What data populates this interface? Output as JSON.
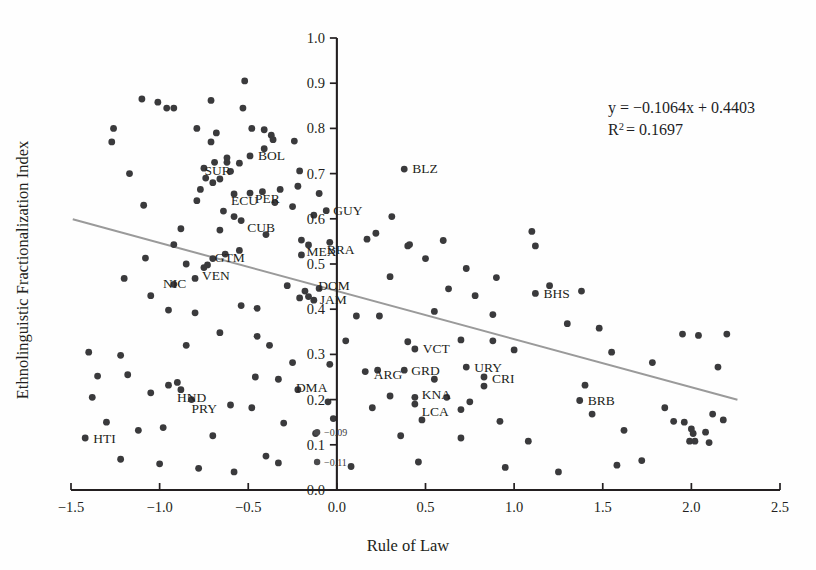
{
  "figure": {
    "background_color": "#fefefe",
    "point_color": "#3a3a3c",
    "trendline_color": "#9a9a9a",
    "axis_color": "#231f20"
  },
  "annotations": {
    "equation": "y = −0.1064x + 0.4403",
    "r_squared_prefix": "R",
    "r_squared_sup": "2",
    "r_squared_value": "= 0.1697",
    "mini_labels": [
      {
        "text": "−0.09",
        "x": -0.01,
        "y": 0.128
      },
      {
        "text": "−0.11",
        "x": -0.01,
        "y": 0.062
      }
    ]
  },
  "chart_data": {
    "type": "scatter",
    "title": "",
    "xlabel": "Rule of Law",
    "ylabel": "Ethnolinguistic Fractionalization Index",
    "xlim": [
      -1.5,
      2.5
    ],
    "ylim": [
      0.0,
      1.0
    ],
    "xticks": [
      -1.5,
      -1.0,
      -0.5,
      0.0,
      0.5,
      1.0,
      1.5,
      2.0,
      2.5
    ],
    "xtick_labels": [
      "−1.5",
      "−1.0",
      "−0.5",
      "0.0",
      "0.5",
      "1.0",
      "1.5",
      "2.0",
      "2.5"
    ],
    "yticks": [
      0.0,
      0.1,
      0.2,
      0.3,
      0.4,
      0.5,
      0.6,
      0.7,
      0.8,
      0.9,
      1.0
    ],
    "ytick_labels": [
      "0.0",
      "0.1",
      "0.2",
      "0.3",
      "0.4",
      "0.5",
      "0.6",
      "0.7",
      "0.8",
      "0.9",
      "1.0"
    ],
    "grid": false,
    "legend": "none",
    "yaxis_position_on_x": 0.0,
    "trendline": {
      "type": "linear",
      "slope": -0.1064,
      "intercept": 0.4403,
      "x_start": -1.49,
      "x_end": 2.26,
      "equation_label": "y = −0.1064x + 0.4403",
      "r_squared": 0.1697
    },
    "labeled_points": [
      {
        "code": "BOL",
        "x": -0.49,
        "y": 0.739,
        "label_dx": 8,
        "label_dy": 4
      },
      {
        "code": "SUR",
        "x": -0.6,
        "y": 0.705,
        "label_dx": -26,
        "label_dy": 4
      },
      {
        "code": "ECU",
        "x": -0.58,
        "y": 0.655,
        "label_dx": -3,
        "label_dy": 11
      },
      {
        "code": "PER",
        "x": -0.49,
        "y": 0.657,
        "label_dx": 5,
        "label_dy": 10
      },
      {
        "code": "CUB",
        "x": -0.54,
        "y": 0.596,
        "label_dx": 6,
        "label_dy": 11
      },
      {
        "code": "GUY",
        "x": -0.06,
        "y": 0.618,
        "label_dx": 7,
        "label_dy": 4
      },
      {
        "code": "MEX",
        "x": -0.16,
        "y": 0.542,
        "label_dx": -2,
        "label_dy": 11
      },
      {
        "code": "BRA",
        "x": -0.04,
        "y": 0.548,
        "label_dx": -3,
        "label_dy": 12
      },
      {
        "code": "GTM",
        "x": -0.7,
        "y": 0.512,
        "label_dx": 2,
        "label_dy": 3
      },
      {
        "code": "VEN",
        "x": -0.75,
        "y": 0.492,
        "label_dx": -2,
        "label_dy": 12
      },
      {
        "code": "NIC",
        "x": -0.8,
        "y": 0.468,
        "label_dx": -32,
        "label_dy": 10
      },
      {
        "code": "DOM",
        "x": -0.1,
        "y": 0.446,
        "label_dx": -1,
        "label_dy": 2
      },
      {
        "code": "JAM",
        "x": -0.13,
        "y": 0.42,
        "label_dx": 6,
        "label_dy": 4
      },
      {
        "code": "BLZ",
        "x": 0.38,
        "y": 0.71,
        "label_dx": 8,
        "label_dy": 4
      },
      {
        "code": "BHS",
        "x": 1.12,
        "y": 0.435,
        "label_dx": 8,
        "label_dy": 5
      },
      {
        "code": "VCT",
        "x": 0.44,
        "y": 0.312,
        "label_dx": 8,
        "label_dy": 4
      },
      {
        "code": "ARG",
        "x": 0.23,
        "y": 0.265,
        "label_dx": -4,
        "label_dy": 9
      },
      {
        "code": "GRD",
        "x": 0.38,
        "y": 0.265,
        "label_dx": 7,
        "label_dy": 5
      },
      {
        "code": "URY",
        "x": 0.73,
        "y": 0.272,
        "label_dx": 8,
        "label_dy": 5
      },
      {
        "code": "CRI",
        "x": 0.83,
        "y": 0.25,
        "label_dx": 8,
        "label_dy": 6
      },
      {
        "code": "KNA",
        "x": 0.44,
        "y": 0.205,
        "label_dx": 7,
        "label_dy": 2
      },
      {
        "code": "LCA",
        "x": 0.44,
        "y": 0.19,
        "label_dx": 7,
        "label_dy": 12
      },
      {
        "code": "DMA",
        "x": -0.22,
        "y": 0.222,
        "label_dx": -2,
        "label_dy": 2
      },
      {
        "code": "HND",
        "x": -0.88,
        "y": 0.222,
        "label_dx": -4,
        "label_dy": 12
      },
      {
        "code": "PRY",
        "x": -0.82,
        "y": 0.2,
        "label_dx": 0,
        "label_dy": 13
      },
      {
        "code": "HTI",
        "x": -1.42,
        "y": 0.115,
        "label_dx": 8,
        "label_dy": 5
      },
      {
        "code": "BRB",
        "x": 1.37,
        "y": 0.198,
        "label_dx": 8,
        "label_dy": 4
      }
    ],
    "unlabeled_points": [
      [
        -1.1,
        0.865
      ],
      [
        -1.01,
        0.858
      ],
      [
        -0.96,
        0.845
      ],
      [
        -0.92,
        0.845
      ],
      [
        -0.71,
        0.862
      ],
      [
        -0.52,
        0.905
      ],
      [
        -0.53,
        0.845
      ],
      [
        -1.26,
        0.8
      ],
      [
        -1.27,
        0.77
      ],
      [
        -0.79,
        0.8
      ],
      [
        -0.68,
        0.79
      ],
      [
        -0.48,
        0.8
      ],
      [
        -0.41,
        0.797
      ],
      [
        -0.37,
        0.785
      ],
      [
        -0.36,
        0.775
      ],
      [
        -0.41,
        0.755
      ],
      [
        -0.71,
        0.77
      ],
      [
        -0.24,
        0.772
      ],
      [
        -0.69,
        0.725
      ],
      [
        -0.75,
        0.712
      ],
      [
        -0.55,
        0.723
      ],
      [
        -1.17,
        0.7
      ],
      [
        -0.21,
        0.706
      ],
      [
        -0.74,
        0.69
      ],
      [
        -0.7,
        0.68
      ],
      [
        -0.66,
        0.688
      ],
      [
        -0.62,
        0.735
      ],
      [
        -0.62,
        0.725
      ],
      [
        -0.77,
        0.665
      ],
      [
        -0.32,
        0.665
      ],
      [
        -0.22,
        0.672
      ],
      [
        -0.42,
        0.66
      ],
      [
        -0.1,
        0.656
      ],
      [
        -0.79,
        0.64
      ],
      [
        -0.64,
        0.617
      ],
      [
        -0.58,
        0.605
      ],
      [
        -0.35,
        0.636
      ],
      [
        -0.25,
        0.627
      ],
      [
        -1.09,
        0.63
      ],
      [
        -0.13,
        0.608
      ],
      [
        -0.88,
        0.578
      ],
      [
        -0.66,
        0.575
      ],
      [
        -0.4,
        0.565
      ],
      [
        -0.2,
        0.553
      ],
      [
        0.31,
        0.605
      ],
      [
        -0.92,
        0.543
      ],
      [
        -0.63,
        0.522
      ],
      [
        -0.55,
        0.53
      ],
      [
        -0.2,
        0.52
      ],
      [
        0.5,
        0.512
      ],
      [
        -1.08,
        0.513
      ],
      [
        -0.85,
        0.5
      ],
      [
        -0.73,
        0.498
      ],
      [
        0.17,
        0.555
      ],
      [
        0.22,
        0.568
      ],
      [
        0.6,
        0.552
      ],
      [
        0.4,
        0.54
      ],
      [
        0.41,
        0.543
      ],
      [
        0.73,
        0.49
      ],
      [
        1.1,
        0.572
      ],
      [
        1.12,
        0.54
      ],
      [
        -1.2,
        0.468
      ],
      [
        -0.92,
        0.455
      ],
      [
        -0.28,
        0.452
      ],
      [
        -0.18,
        0.44
      ],
      [
        -0.16,
        0.428
      ],
      [
        -0.21,
        0.425
      ],
      [
        0.63,
        0.445
      ],
      [
        0.78,
        0.43
      ],
      [
        0.9,
        0.47
      ],
      [
        1.2,
        0.452
      ],
      [
        1.38,
        0.44
      ],
      [
        -0.54,
        0.408
      ],
      [
        -0.45,
        0.402
      ],
      [
        0.11,
        0.385
      ],
      [
        0.24,
        0.385
      ],
      [
        0.55,
        0.395
      ],
      [
        0.88,
        0.388
      ],
      [
        1.3,
        0.368
      ],
      [
        1.48,
        0.358
      ],
      [
        1.95,
        0.345
      ],
      [
        2.04,
        0.342
      ],
      [
        -0.85,
        0.32
      ],
      [
        -0.66,
        0.348
      ],
      [
        0.05,
        0.33
      ],
      [
        0.4,
        0.328
      ],
      [
        0.7,
        0.332
      ],
      [
        0.88,
        0.33
      ],
      [
        -1.4,
        0.305
      ],
      [
        -1.22,
        0.298
      ],
      [
        -0.25,
        0.282
      ],
      [
        -0.04,
        0.278
      ],
      [
        0.16,
        0.262
      ],
      [
        0.55,
        0.245
      ],
      [
        0.83,
        0.23
      ],
      [
        1.0,
        0.31
      ],
      [
        -1.35,
        0.252
      ],
      [
        -1.18,
        0.255
      ],
      [
        -0.46,
        0.25
      ],
      [
        -0.33,
        0.245
      ],
      [
        0.3,
        0.208
      ],
      [
        0.62,
        0.205
      ],
      [
        0.75,
        0.195
      ],
      [
        0.7,
        0.178
      ],
      [
        -1.38,
        0.205
      ],
      [
        -1.05,
        0.215
      ],
      [
        -0.95,
        0.232
      ],
      [
        -0.9,
        0.238
      ],
      [
        -0.6,
        0.188
      ],
      [
        -0.48,
        0.182
      ],
      [
        0.2,
        0.182
      ],
      [
        0.48,
        0.155
      ],
      [
        1.4,
        0.232
      ],
      [
        1.44,
        0.168
      ],
      [
        -1.3,
        0.15
      ],
      [
        -1.12,
        0.132
      ],
      [
        -0.98,
        0.138
      ],
      [
        -0.7,
        0.12
      ],
      [
        -0.3,
        0.148
      ],
      [
        -0.12,
        0.125
      ],
      [
        0.36,
        0.12
      ],
      [
        0.7,
        0.115
      ],
      [
        1.62,
        0.132
      ],
      [
        1.85,
        0.182
      ],
      [
        1.9,
        0.152
      ],
      [
        1.96,
        0.15
      ],
      [
        2.0,
        0.135
      ],
      [
        2.01,
        0.125
      ],
      [
        1.99,
        0.108
      ],
      [
        2.02,
        0.108
      ],
      [
        2.08,
        0.128
      ],
      [
        2.12,
        0.168
      ],
      [
        2.1,
        0.105
      ],
      [
        2.18,
        0.155
      ],
      [
        1.72,
        0.065
      ],
      [
        1.58,
        0.055
      ],
      [
        -1.22,
        0.068
      ],
      [
        -1.0,
        0.058
      ],
      [
        -0.78,
        0.048
      ],
      [
        -0.58,
        0.04
      ],
      [
        -0.4,
        0.075
      ],
      [
        -0.33,
        0.06
      ],
      [
        0.08,
        0.052
      ],
      [
        0.46,
        0.062
      ],
      [
        0.95,
        0.05
      ],
      [
        1.25,
        0.04
      ],
      [
        -0.95,
        0.398
      ],
      [
        -0.8,
        0.392
      ],
      [
        -1.05,
        0.43
      ],
      [
        0.3,
        0.472
      ],
      [
        1.55,
        0.305
      ],
      [
        1.78,
        0.282
      ],
      [
        2.2,
        0.345
      ],
      [
        2.15,
        0.272
      ],
      [
        -0.45,
        0.34
      ],
      [
        -0.38,
        0.32
      ],
      [
        0.92,
        0.152
      ],
      [
        1.08,
        0.108
      ],
      [
        -0.05,
        0.195
      ],
      [
        -0.02,
        0.158
      ]
    ]
  }
}
